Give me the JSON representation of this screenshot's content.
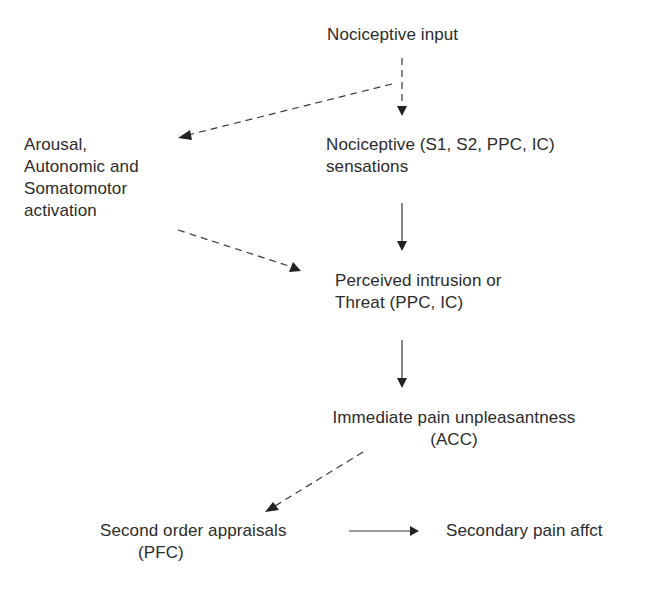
{
  "diagram": {
    "type": "flowchart",
    "background_color": "#ffffff",
    "text_color": "#2b2b2b",
    "arrow_color": "#3a3a3a",
    "nodes": {
      "nociceptive_input": {
        "lines": [
          "Nociceptive input"
        ]
      },
      "arousal": {
        "lines": [
          "Arousal,",
          "Autonomic and",
          "Somatomotor",
          "activation"
        ]
      },
      "nociceptive_sensations": {
        "lines": [
          "Nociceptive (S1, S2, PPC, IC)",
          "sensations"
        ]
      },
      "perceived_threat": {
        "lines": [
          "Perceived intrusion or",
          "Threat (PPC, IC)"
        ]
      },
      "immediate_unpleasantness": {
        "lines": [
          "Immediate pain unpleasantness",
          "(ACC)"
        ]
      },
      "second_order_appraisals": {
        "lines": [
          "Second order appraisals",
          "(PFC)"
        ]
      },
      "secondary_affect": {
        "lines": [
          "Secondary pain affct"
        ]
      }
    },
    "edges": [
      {
        "from": "nociceptive_input",
        "to": "nociceptive_sensations",
        "style": "dashed"
      },
      {
        "from": "nociceptive_input",
        "to": "arousal",
        "style": "dashed"
      },
      {
        "from": "arousal",
        "to": "perceived_threat",
        "style": "dashed"
      },
      {
        "from": "nociceptive_sensations",
        "to": "perceived_threat",
        "style": "solid"
      },
      {
        "from": "perceived_threat",
        "to": "immediate_unpleasantness",
        "style": "solid"
      },
      {
        "from": "immediate_unpleasantness",
        "to": "second_order_appraisals",
        "style": "dashed"
      },
      {
        "from": "second_order_appraisals",
        "to": "secondary_affect",
        "style": "solid"
      }
    ]
  }
}
